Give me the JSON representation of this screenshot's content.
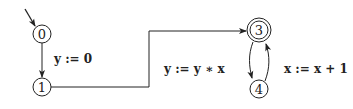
{
  "diagram": {
    "type": "automaton",
    "nodes": [
      {
        "id": "0",
        "label": "0",
        "initial": true,
        "accepting": false
      },
      {
        "id": "1",
        "label": "1",
        "initial": false,
        "accepting": false
      },
      {
        "id": "3",
        "label": "3",
        "initial": false,
        "accepting": true
      },
      {
        "id": "4",
        "label": "4",
        "initial": false,
        "accepting": false
      }
    ],
    "edges": [
      {
        "from": "0",
        "to": "1",
        "label": "y := 0"
      },
      {
        "from": "1",
        "to": "3",
        "label": ""
      },
      {
        "from": "3",
        "to": "4",
        "label": "y := y ∗ x"
      },
      {
        "from": "4",
        "to": "3",
        "label": "x := x + 1"
      }
    ]
  },
  "colors": {
    "stroke": "#222222",
    "background": "#ffffff"
  }
}
